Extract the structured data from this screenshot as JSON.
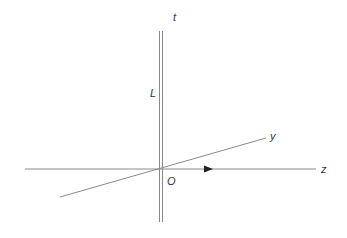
{
  "diagram": {
    "type": "3d-axes",
    "labels": {
      "t": "t",
      "L": "L",
      "y": "y",
      "z": "z",
      "origin": "O"
    },
    "colors": {
      "line": "#8a8a8a",
      "text": "#333333",
      "arrow": "#222222"
    },
    "elements": [
      {
        "name": "t-axis",
        "kind": "double-line",
        "from": [
          161,
          31
        ],
        "to": [
          161,
          222
        ]
      },
      {
        "name": "z-axis",
        "kind": "line",
        "from": [
          25,
          169
        ],
        "to": [
          316,
          169
        ],
        "arrow_at": [
          211,
          169
        ]
      },
      {
        "name": "y-axis",
        "kind": "line",
        "from": [
          60,
          197
        ],
        "to": [
          266,
          138
        ]
      }
    ]
  }
}
